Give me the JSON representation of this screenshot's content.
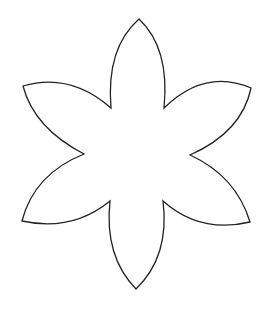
{
  "figure": {
    "title": "Six-petal flower outline",
    "background": "#ffffff",
    "stroke": "#222222",
    "stroke_width": 1.3,
    "fill": "#ffffff",
    "petals": [
      {
        "name": "top",
        "tip": [
          139,
          19
        ]
      },
      {
        "name": "upper-right",
        "tip": [
          251,
          88
        ]
      },
      {
        "name": "lower-right",
        "tip": [
          250,
          222
        ]
      },
      {
        "name": "bottom",
        "tip": [
          136,
          289
        ]
      },
      {
        "name": "lower-left",
        "tip": [
          22,
          221
        ]
      },
      {
        "name": "upper-left",
        "tip": [
          23,
          86
        ]
      }
    ],
    "path": "M111,108 Q106,48 139,19 Q170,48 164,108 Q205,68 251,88 Q242,132 190,155 Q236,176 250,222 Q200,234 163,201 Q170,256 136,289 Q104,256 110,201 Q72,232 22,221 Q34,174 84,154 Q34,128 23,86 Q70,72 111,108 Z"
  }
}
